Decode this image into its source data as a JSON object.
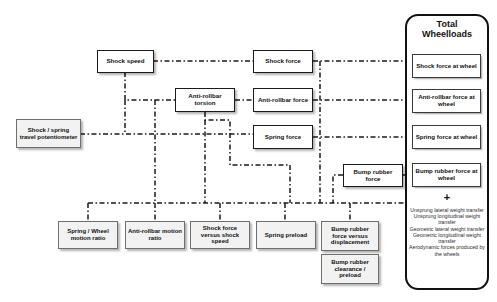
{
  "diagram": {
    "type": "flowchart",
    "background_color": "#ffffff",
    "line_color": "#1a1a1a",
    "line_style": "dash-dot"
  },
  "nodes": {
    "shock_speed": {
      "label": "Shock speed"
    },
    "shock_spring_potentiometer": {
      "label": "Shock / spring travel potentiometer"
    },
    "antirollbar_torsion": {
      "label": "Anti-rollbar torsion"
    },
    "shock_force": {
      "label": "Shock force"
    },
    "antirollbar_force": {
      "label": "Anti-rollbar force"
    },
    "spring_force": {
      "label": "Spring force"
    },
    "bump_rubber_force": {
      "label": "Bump rubber force"
    },
    "spring_wheel_motion_ratio": {
      "label": "Spring / Wheel motion ratio"
    },
    "antirollbar_motion_ratio": {
      "label": "Anti-rollbar motion ratio"
    },
    "shock_force_versus_shock_speed": {
      "label": "Shock force versus shock speed"
    },
    "spring_preload": {
      "label": "Spring preload"
    },
    "bump_rubber_force_versus_displacement": {
      "label": "Bump rubber force versus displacement"
    },
    "bump_rubber_clearance_preload": {
      "label": "Bump rubber clearance / preload"
    }
  },
  "panel": {
    "title_line1": "Total",
    "title_line2": "Wheelloads",
    "plus_symbol": "+",
    "items": [
      {
        "label": "Shock force at wheel"
      },
      {
        "label": "Anti-rollbar force at wheel"
      },
      {
        "label": "Spring force at wheel"
      },
      {
        "label": "Bump rubber force at wheel"
      }
    ],
    "extras": [
      "Unsprung lateral weight transfer",
      "Unsprung longitudinal weight transfer",
      "Geometric lateral weight transfer",
      "Geometric longitudinal weight transfer",
      "Aerodynamic forces produced by the wheels"
    ]
  }
}
